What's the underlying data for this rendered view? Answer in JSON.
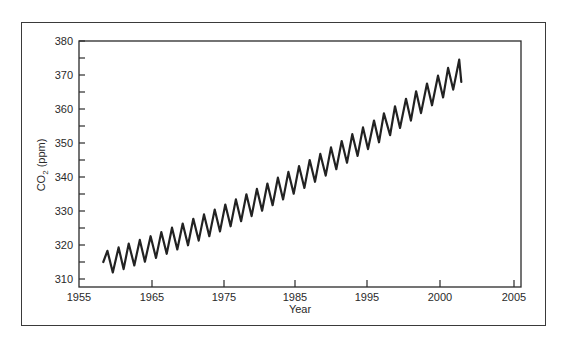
{
  "chart_data": {
    "type": "line",
    "title": "",
    "xlabel": "Year",
    "ylabel": "CO2 (ppm)",
    "ylabel_main": "CO",
    "ylabel_sub": "2",
    "ylabel_unit": " (ppm)",
    "xlim": [
      1955,
      2005
    ],
    "ylim": [
      307,
      380
    ],
    "grid": false,
    "legend": null,
    "x_ticks": [
      {
        "label": "1955",
        "value": 1955,
        "px": 79
      },
      {
        "label": "1965",
        "value": 1965,
        "px": 152
      },
      {
        "label": "1975",
        "value": 1975,
        "px": 224
      },
      {
        "label": "1985",
        "value": 1985,
        "px": 295
      },
      {
        "label": "1995",
        "value": 1995,
        "px": 367
      },
      {
        "label": "2000",
        "value": 2000,
        "px": 440
      },
      {
        "label": "2005",
        "value": 2005,
        "px": 514
      }
    ],
    "y_ticks": [
      {
        "label": "310",
        "value": 310
      },
      {
        "label": "320",
        "value": 320
      },
      {
        "label": "330",
        "value": 330
      },
      {
        "label": "340",
        "value": 340
      },
      {
        "label": "350",
        "value": 350
      },
      {
        "label": "360",
        "value": 360
      },
      {
        "label": "370",
        "value": 370
      },
      {
        "label": "380",
        "value": 380
      }
    ],
    "y_minor_ticks": [
      315,
      325,
      335,
      345,
      355,
      365,
      375
    ],
    "series": [
      {
        "name": "Atmospheric CO2 (monthly, seasonal cycle)",
        "color": "#222222",
        "points": [
          [
            1958.33,
            315.0
          ],
          [
            1958.89,
            318.3
          ],
          [
            1959.63,
            311.9
          ],
          [
            1960.42,
            319.3
          ],
          [
            1961.11,
            312.9
          ],
          [
            1961.81,
            320.4
          ],
          [
            1962.57,
            314.0
          ],
          [
            1963.33,
            321.5
          ],
          [
            1964.03,
            315.1
          ],
          [
            1964.81,
            322.6
          ],
          [
            1965.56,
            316.2
          ],
          [
            1966.29,
            323.8
          ],
          [
            1967.04,
            317.4
          ],
          [
            1967.78,
            325.1
          ],
          [
            1968.52,
            318.7
          ],
          [
            1969.26,
            326.3
          ],
          [
            1970.0,
            319.9
          ],
          [
            1970.74,
            327.7
          ],
          [
            1971.48,
            321.3
          ],
          [
            1972.22,
            329.0
          ],
          [
            1972.96,
            322.6
          ],
          [
            1973.71,
            330.4
          ],
          [
            1974.44,
            324.0
          ],
          [
            1975.19,
            331.9
          ],
          [
            1975.93,
            325.5
          ],
          [
            1976.67,
            333.4
          ],
          [
            1977.41,
            327.0
          ],
          [
            1978.15,
            334.9
          ],
          [
            1978.89,
            328.5
          ],
          [
            1979.63,
            336.5
          ],
          [
            1980.37,
            330.1
          ],
          [
            1981.11,
            338.1
          ],
          [
            1981.85,
            331.7
          ],
          [
            1982.59,
            339.8
          ],
          [
            1983.33,
            333.4
          ],
          [
            1984.07,
            341.5
          ],
          [
            1984.81,
            335.1
          ],
          [
            1985.56,
            343.2
          ],
          [
            1986.3,
            336.8
          ],
          [
            1987.04,
            345.0
          ],
          [
            1987.78,
            338.6
          ],
          [
            1988.52,
            346.8
          ],
          [
            1989.26,
            340.4
          ],
          [
            1990.0,
            348.7
          ],
          [
            1990.74,
            342.3
          ],
          [
            1991.48,
            350.6
          ],
          [
            1992.22,
            344.2
          ],
          [
            1992.96,
            352.6
          ],
          [
            1993.7,
            346.2
          ],
          [
            1994.44,
            354.6
          ],
          [
            1995.07,
            348.2
          ],
          [
            1995.48,
            356.6
          ],
          [
            1995.82,
            350.2
          ],
          [
            1996.16,
            358.7
          ],
          [
            1996.58,
            352.3
          ],
          [
            1996.92,
            360.8
          ],
          [
            1997.26,
            354.4
          ],
          [
            1997.67,
            363.0
          ],
          [
            1998.01,
            356.6
          ],
          [
            1998.36,
            365.2
          ],
          [
            1998.7,
            358.8
          ],
          [
            1999.11,
            367.5
          ],
          [
            1999.45,
            361.1
          ],
          [
            1999.86,
            369.8
          ],
          [
            2000.21,
            363.4
          ],
          [
            2000.55,
            372.1
          ],
          [
            2000.89,
            365.7
          ],
          [
            2001.3,
            374.5
          ],
          [
            2001.44,
            368.0
          ]
        ]
      }
    ]
  },
  "layout": {
    "plot": {
      "left": 79,
      "top": 41,
      "right": 521,
      "bottom": 287
    },
    "y_px_per_unit": 3.4,
    "y_ref_value": 380,
    "y_ref_px": 41
  }
}
